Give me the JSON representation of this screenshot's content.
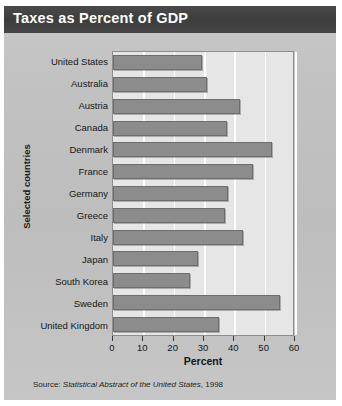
{
  "figure": {
    "title": "Taxes as Percent of GDP",
    "source_prefix": "Source:",
    "source_title": "Statistical Abstract of the United States",
    "source_year": ", 1998"
  },
  "chart_data": {
    "type": "bar",
    "orientation": "horizontal",
    "title": "Taxes as Percent of GDP",
    "xlabel": "Percent",
    "ylabel": "Selected countries",
    "xlim": [
      0,
      60
    ],
    "xticks": [
      0,
      10,
      20,
      30,
      40,
      50,
      60
    ],
    "xtick_labels": [
      "0",
      "10",
      "20",
      "30",
      "40",
      "50",
      "60"
    ],
    "grid": "vertical-white",
    "legend": "none",
    "bar_color": "#8c8c8c",
    "plot_background": "#e6e6e6",
    "header_color": "#414141",
    "categories": [
      "United States",
      "Australia",
      "Austria",
      "Canada",
      "Denmark",
      "France",
      "Germany",
      "Greece",
      "Italy",
      "Japan",
      "South Korea",
      "Sweden",
      "United Kingdom"
    ],
    "values": [
      29.5,
      31.0,
      42.0,
      37.5,
      52.5,
      46.0,
      38.0,
      37.0,
      43.0,
      28.0,
      25.5,
      55.0,
      35.0
    ]
  }
}
